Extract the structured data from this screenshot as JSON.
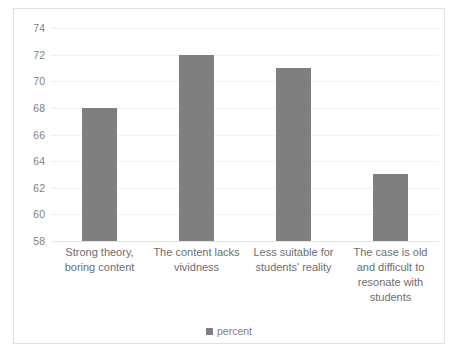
{
  "chart_data": {
    "type": "bar",
    "title": "",
    "xlabel": "",
    "ylabel": "",
    "categories": [
      "Strong theory, boring content",
      "The content lacks vividness",
      "Less suitable for students' reality",
      "The case is old and difficult to resonate with students"
    ],
    "series": [
      {
        "name": "percent",
        "values": [
          68,
          72,
          71,
          63
        ]
      }
    ],
    "values": [
      68,
      72,
      71,
      63
    ],
    "ylim": [
      58,
      74
    ],
    "yticks": [
      58,
      60,
      62,
      64,
      66,
      68,
      70,
      72,
      74
    ],
    "ytick_labels": [
      "58",
      "60",
      "62",
      "64",
      "66",
      "68",
      "70",
      "72",
      "74"
    ],
    "grid": true,
    "legend": {
      "position": "bottom",
      "entries": [
        "percent"
      ]
    },
    "colors": {
      "bar": "#7f7f7f",
      "gridline": "#f2f2f2",
      "frame": "#e2e2e2",
      "tick_text": "#7f7f7f",
      "category_text": "#6d6d6d"
    }
  },
  "legend": {
    "label": "percent"
  }
}
